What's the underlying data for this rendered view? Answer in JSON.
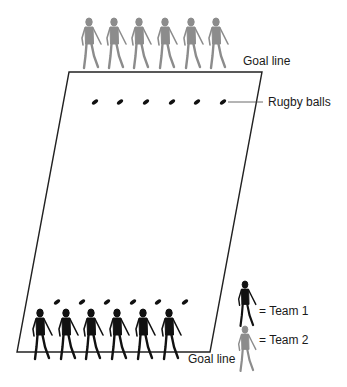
{
  "diagram": {
    "labels": {
      "goal_line_top": "Goal line",
      "rugby_balls": "Rugby balls",
      "goal_line_bottom": "Goal line"
    },
    "legend": {
      "team1": "= Team 1",
      "team2": "= Team 2"
    },
    "colors": {
      "team1": "#111111",
      "team2": "#8c8c8c",
      "field_line": "#222222",
      "ball": "#111111"
    },
    "team2_players_count": 6,
    "team1_players_count": 6,
    "rugby_balls_top_count": 6,
    "rugby_balls_bottom_count": 6
  }
}
